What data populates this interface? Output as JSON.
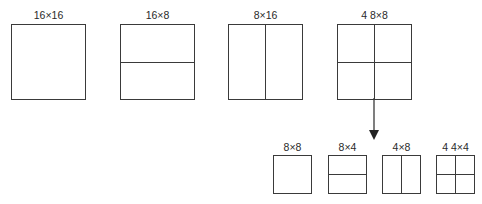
{
  "diagram": {
    "type": "block-partitioning",
    "top_row": [
      {
        "label": "16×16",
        "split": "none"
      },
      {
        "label": "16×8",
        "split": "horizontal"
      },
      {
        "label": "8×16",
        "split": "vertical"
      },
      {
        "label": "4 8×8",
        "split": "quad"
      }
    ],
    "arrow": {
      "from": "4 8×8",
      "direction": "down"
    },
    "bottom_row": [
      {
        "label": "8×8",
        "split": "none"
      },
      {
        "label": "8×4",
        "split": "horizontal"
      },
      {
        "label": "4×8",
        "split": "vertical"
      },
      {
        "label": "4 4×4",
        "split": "quad"
      }
    ],
    "line_color": "#3a3a3a"
  }
}
